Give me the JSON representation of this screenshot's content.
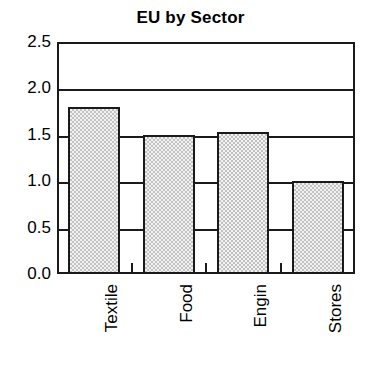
{
  "chart_data": {
    "type": "bar",
    "title": "EU by Sector",
    "xlabel": "",
    "ylabel": "",
    "categories": [
      "Textile",
      "Food",
      "Engin",
      "Stores"
    ],
    "values": [
      1.8,
      1.5,
      1.53,
      1.0
    ],
    "ylim": [
      0.0,
      2.5
    ],
    "ytick_labels": [
      "0.0",
      "0.5",
      "1.0",
      "1.5",
      "2.0",
      "2.5"
    ],
    "ytick_values": [
      0.0,
      0.5,
      1.0,
      1.5,
      2.0,
      2.5
    ],
    "grid": true,
    "legend": false,
    "legend_position": "none",
    "bar_fill_color": "#d9d9d9",
    "bar_edge_color": "#1a1a1a",
    "axis_color": "#1a1a1a",
    "background_color": "#ffffff",
    "xlabel_rotation": 90
  }
}
